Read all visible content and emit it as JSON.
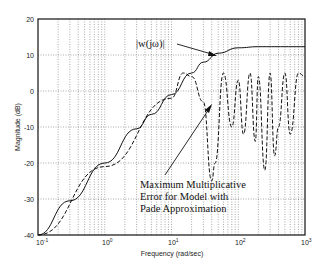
{
  "chart_data": {
    "type": "line",
    "title": "",
    "xlabel": "Frequency (rad/sec)",
    "ylabel": "Magnitude (dB)",
    "xscale": "log",
    "xlim": [
      0.1,
      1000
    ],
    "ylim": [
      -40,
      20
    ],
    "grid": true,
    "x_ticks": [
      "10^-1",
      "10^0",
      "10^1",
      "10^2",
      "10^3"
    ],
    "y_ticks": [
      20,
      10,
      0,
      -10,
      -20,
      -30,
      -40
    ],
    "series": [
      {
        "name": "|w(jω)|",
        "style": "solid",
        "x": [
          0.1,
          0.3,
          1,
          3,
          5,
          10,
          20,
          30,
          50,
          100,
          200,
          500,
          1000
        ],
        "values": [
          -40,
          -30.5,
          -20,
          -10.5,
          -6.5,
          -1,
          5,
          8,
          10.5,
          12,
          12.3,
          12.3,
          12.3
        ]
      },
      {
        "name": "Maximum Multiplicative Error for Model with Pade Approximation",
        "style": "dashed",
        "x": [
          0.1,
          1,
          10,
          15,
          20,
          30,
          40,
          45,
          60,
          80,
          100,
          120,
          150,
          180,
          200,
          250,
          300,
          350,
          400,
          500,
          600,
          800,
          1000
        ],
        "values": [
          -41,
          -21,
          -2,
          5,
          4,
          -3,
          -25,
          -20,
          5,
          -10,
          3,
          -12,
          5,
          -14,
          4,
          -22,
          5,
          -18,
          -10,
          5,
          -12,
          5,
          4
        ]
      }
    ],
    "annotations": [
      {
        "text": "|w(jω)|",
        "x": 50,
        "y": 12
      },
      {
        "text": "Maximum Multiplicative Error for Model with Pade Approximation",
        "x": 40,
        "y": -2
      }
    ]
  },
  "labels": {
    "xlabel": "Frequency (rad/sec)",
    "ylabel": "Magnitude (dB)",
    "annot_w": "|w(jω)|",
    "annot_err_1": "Maximum Multiplicative",
    "annot_err_2": "Error for Model with",
    "annot_err_3": "Pade Approximation",
    "yt0": "20",
    "yt1": "10",
    "yt2": "0",
    "yt3": "-10",
    "yt4": "-20",
    "yt5": "-30",
    "yt6": "-40",
    "xt0": "10",
    "xt1": "10",
    "xt2": "10",
    "xt3": "10",
    "xt4": "10",
    "xe0": "-1",
    "xe1": "0",
    "xe2": "1",
    "xe3": "2",
    "xe4": "3"
  }
}
